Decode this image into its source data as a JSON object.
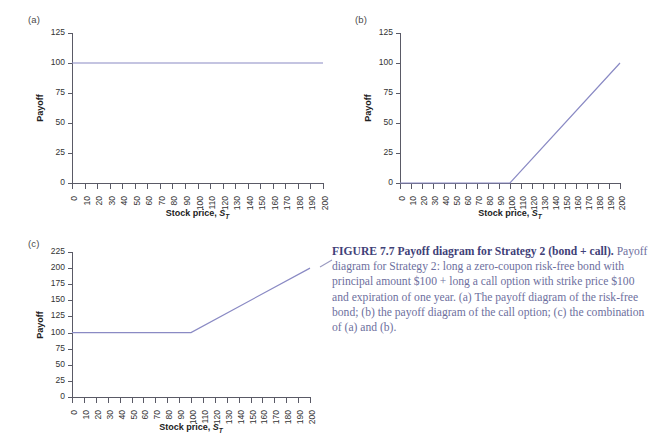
{
  "figure": {
    "panels": [
      {
        "tag": "(a)",
        "y_title": "Payoff",
        "x_title_main": "Stock price, ",
        "x_title_var": "S",
        "x_title_sub": "T",
        "y_ticks": [
          "0",
          "25",
          "50",
          "75",
          "100",
          "125"
        ],
        "x_ticks": [
          "0",
          "10",
          "20",
          "30",
          "40",
          "50",
          "60",
          "70",
          "80",
          "90",
          "100",
          "110",
          "120",
          "130",
          "140",
          "150",
          "160",
          "170",
          "180",
          "190",
          "200"
        ]
      },
      {
        "tag": "(b)",
        "y_title": "Payoff",
        "x_title_main": "Stock price, ",
        "x_title_var": "S",
        "x_title_sub": "T",
        "y_ticks": [
          "0",
          "25",
          "50",
          "75",
          "100",
          "125"
        ],
        "x_ticks": [
          "0",
          "10",
          "20",
          "30",
          "40",
          "50",
          "60",
          "70",
          "80",
          "90",
          "100",
          "110",
          "120",
          "130",
          "140",
          "150",
          "160",
          "170",
          "180",
          "190",
          "200"
        ]
      },
      {
        "tag": "(c)",
        "y_title": "Payoff",
        "x_title_main": "Stock price, ",
        "x_title_var": "S",
        "x_title_sub": "T",
        "y_ticks": [
          "0",
          "25",
          "50",
          "75",
          "100",
          "125",
          "150",
          "175",
          "200",
          "225"
        ],
        "x_ticks": [
          "0",
          "10",
          "20",
          "30",
          "40",
          "50",
          "60",
          "70",
          "80",
          "90",
          "100",
          "110",
          "120",
          "130",
          "140",
          "150",
          "160",
          "170",
          "180",
          "190",
          "200"
        ]
      }
    ],
    "line_color": "#8a8ac4",
    "axis_color": "#5a5a66",
    "caption_color": "#6d6f9e",
    "caption": {
      "lead": "FIGURE 7.7  Payoff diagram for Strategy 2 (bond + call).",
      "body": " Payoff diagram for Strategy 2: long a zero-coupon risk-free bond with principal amount $100 + long a call option with strike price $100 and expiration of one year. (a) The payoff diagram of the risk-free bond; (b) the payoff diagram of the call option; (c) the combination of (a) and (b)."
    }
  },
  "chart_data": [
    {
      "type": "line",
      "panel": "(a)",
      "title": "Payoff diagram of the risk-free bond",
      "xlabel": "Stock price, S_T",
      "ylabel": "Payoff",
      "xlim": [
        0,
        200
      ],
      "ylim": [
        0,
        125
      ],
      "xticks": [
        0,
        10,
        20,
        30,
        40,
        50,
        60,
        70,
        80,
        90,
        100,
        110,
        120,
        130,
        140,
        150,
        160,
        170,
        180,
        190,
        200
      ],
      "yticks": [
        0,
        25,
        50,
        75,
        100,
        125
      ],
      "grid": false,
      "legend": null,
      "series": [
        {
          "name": "Zero-coupon bond payoff",
          "x": [
            0,
            200
          ],
          "y": [
            100,
            100
          ]
        }
      ]
    },
    {
      "type": "line",
      "panel": "(b)",
      "title": "Payoff diagram of the call option",
      "xlabel": "Stock price, S_T",
      "ylabel": "Payoff",
      "xlim": [
        0,
        200
      ],
      "ylim": [
        0,
        125
      ],
      "xticks": [
        0,
        10,
        20,
        30,
        40,
        50,
        60,
        70,
        80,
        90,
        100,
        110,
        120,
        130,
        140,
        150,
        160,
        170,
        180,
        190,
        200
      ],
      "yticks": [
        0,
        25,
        50,
        75,
        100,
        125
      ],
      "grid": false,
      "legend": null,
      "series": [
        {
          "name": "Call option payoff (strike 100)",
          "x": [
            0,
            100,
            200
          ],
          "y": [
            0,
            0,
            100
          ]
        }
      ]
    },
    {
      "type": "line",
      "panel": "(c)",
      "title": "Combination of (a) and (b)",
      "xlabel": "Stock price, S_T",
      "ylabel": "Payoff",
      "xlim": [
        0,
        200
      ],
      "ylim": [
        0,
        225
      ],
      "xticks": [
        0,
        10,
        20,
        30,
        40,
        50,
        60,
        70,
        80,
        90,
        100,
        110,
        120,
        130,
        140,
        150,
        160,
        170,
        180,
        190,
        200
      ],
      "yticks": [
        0,
        25,
        50,
        75,
        100,
        125,
        150,
        175,
        200,
        225
      ],
      "grid": false,
      "legend": null,
      "series": [
        {
          "name": "Bond + call payoff",
          "x": [
            0,
            100,
            200
          ],
          "y": [
            100,
            100,
            200
          ]
        }
      ]
    }
  ]
}
